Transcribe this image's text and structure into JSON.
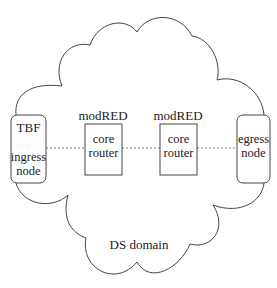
{
  "diagram": {
    "type": "network-topology",
    "colors": {
      "stroke": "#444444",
      "text": "#222222",
      "background": "#ffffff"
    },
    "domain": {
      "label": "DS domain",
      "shape": "cloud"
    },
    "nodes": [
      {
        "id": "ingress",
        "top_label": "TBF",
        "line1": "ingress",
        "line2": "node",
        "shape": "rounded-rect"
      },
      {
        "id": "core1",
        "stereotype": "modRED",
        "line1": "core",
        "line2": "router",
        "shape": "rect"
      },
      {
        "id": "core2",
        "stereotype": "modRED",
        "line1": "core",
        "line2": "router",
        "shape": "rect"
      },
      {
        "id": "egress",
        "line1": "egress",
        "line2": "node",
        "shape": "rounded-rect"
      }
    ],
    "edges": [
      {
        "from": "ingress",
        "to": "core1",
        "style": "dotted"
      },
      {
        "from": "core1",
        "to": "core2",
        "style": "dotted"
      },
      {
        "from": "core2",
        "to": "egress",
        "style": "dotted"
      }
    ]
  }
}
